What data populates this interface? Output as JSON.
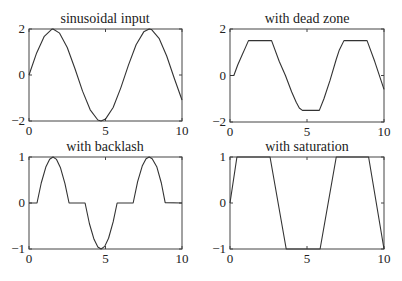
{
  "figure": {
    "width": 402,
    "height": 281,
    "line_color": "#333333",
    "axes_color": "#444444"
  },
  "chart_data": [
    {
      "type": "line",
      "title": "sinusoidal input",
      "xlabel": "",
      "ylabel": "",
      "xlim": [
        0,
        10
      ],
      "ylim": [
        -2,
        2
      ],
      "xticks": [
        0,
        5,
        10
      ],
      "yticks": [
        -2,
        0,
        2
      ],
      "grid": false,
      "box": {
        "left": 29,
        "top": 29,
        "right": 182,
        "bottom": 121
      },
      "function": "2*sin(x)",
      "x": [
        0,
        0.5,
        1,
        1.5,
        1.5708,
        2,
        2.5,
        3,
        3.5,
        4,
        4.5,
        4.7124,
        5,
        5.5,
        6,
        6.5,
        7,
        7.5,
        7.854,
        8,
        8.5,
        9,
        9.5,
        10
      ],
      "y": [
        0,
        0.959,
        1.683,
        1.995,
        2,
        1.819,
        1.197,
        0.282,
        -0.702,
        -1.514,
        -1.955,
        -2,
        -1.918,
        -1.411,
        -0.559,
        0.43,
        1.314,
        1.876,
        2,
        1.979,
        1.596,
        0.824,
        -0.15,
        -1.088
      ]
    },
    {
      "type": "line",
      "title": "with dead zone",
      "xlabel": "",
      "ylabel": "",
      "xlim": [
        0,
        10
      ],
      "ylim": [
        -2,
        2
      ],
      "xticks": [
        0,
        5,
        10
      ],
      "yticks": [
        -2,
        0,
        2
      ],
      "grid": false,
      "box": {
        "left": 230,
        "top": 29,
        "right": 384,
        "bottom": 122
      },
      "x": [
        0,
        0.25,
        0.5,
        0.8,
        1.0,
        1.2,
        2.7,
        3.2,
        3.6,
        4.0,
        4.3,
        4.5,
        4.7,
        5.8,
        6.1,
        6.5,
        6.9,
        7.1,
        7.4,
        8.9,
        9.4,
        10
      ],
      "y": [
        0,
        0,
        0.45,
        0.9,
        1.2,
        1.5,
        1.5,
        0.6,
        0,
        -0.7,
        -1.15,
        -1.4,
        -1.5,
        -1.5,
        -1.0,
        -0.2,
        0.7,
        1.1,
        1.5,
        1.5,
        0.6,
        -0.6
      ]
    },
    {
      "type": "line",
      "title": "with backlash",
      "xlabel": "",
      "ylabel": "",
      "xlim": [
        0,
        10
      ],
      "ylim": [
        -1,
        1
      ],
      "xticks": [
        0,
        5,
        10
      ],
      "yticks": [
        -1,
        0,
        1
      ],
      "grid": false,
      "box": {
        "left": 29,
        "top": 157,
        "right": 182,
        "bottom": 249
      },
      "function": "sign(sin x)*max(0,|2 sin x|-1)",
      "x": [
        0,
        0.5236,
        0.8,
        1.1,
        1.35,
        1.5708,
        1.8,
        2.05,
        2.35,
        2.618,
        3.665,
        3.95,
        4.25,
        4.5,
        4.7124,
        4.95,
        5.2,
        5.5,
        5.76,
        6.807,
        7.1,
        7.4,
        7.65,
        7.854,
        8.05,
        8.35,
        8.65,
        8.9,
        10
      ],
      "y": [
        0,
        0,
        0.435,
        0.782,
        0.952,
        1,
        0.948,
        0.774,
        0.422,
        0,
        0,
        -0.451,
        -0.789,
        -0.955,
        -1,
        -0.943,
        -0.766,
        -0.411,
        0,
        0,
        0.466,
        0.802,
        0.96,
        1,
        0.963,
        0.79,
        0.435,
        0.009,
        0
      ]
    },
    {
      "type": "line",
      "title": "with saturation",
      "xlabel": "",
      "ylabel": "",
      "xlim": [
        0,
        10
      ],
      "ylim": [
        -1,
        1
      ],
      "xticks": [
        0,
        5,
        10
      ],
      "yticks": [
        -1,
        0,
        1
      ],
      "grid": false,
      "box": {
        "left": 230,
        "top": 157,
        "right": 384,
        "bottom": 249
      },
      "x": [
        0,
        0.45,
        2.6,
        3.65,
        5.85,
        6.9,
        9.0,
        10
      ],
      "y": [
        0,
        1,
        1,
        -1,
        -1,
        1,
        1,
        -1
      ]
    }
  ]
}
